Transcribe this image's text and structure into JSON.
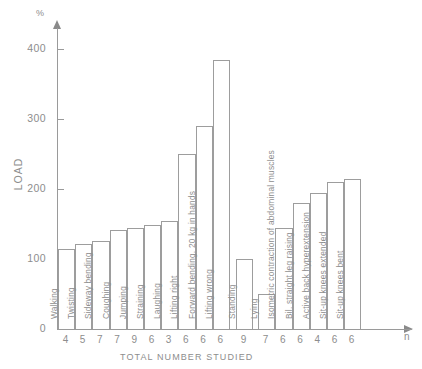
{
  "chart_data": {
    "type": "bar",
    "title": "",
    "xlabel": "TOTAL NUMBER STUDIED",
    "ylabel": "LOAD",
    "yunit": "%",
    "n_axis_label": "n",
    "ylim": [
      0,
      430
    ],
    "yticks": [
      0,
      100,
      200,
      300,
      400
    ],
    "ytick_labels": [
      "0",
      "100",
      "200",
      "300",
      "400"
    ],
    "grid": false,
    "legend": "none",
    "categories": [
      "Walking",
      "Twisting",
      "Sideway bending",
      "Coughing",
      "Jumping",
      "Straining",
      "Laughing",
      "Lifting right",
      "Forward bending. 20 kg in hands",
      "Lifting wrong",
      "Standing",
      "Lying",
      "Isometric contraction of abdominal muscles",
      "Bil. straight leg raising",
      "Active back hyperextension",
      "Sit-up knees extended",
      "Sit-up knees bent"
    ],
    "values": [
      115,
      121,
      126,
      141,
      144,
      149,
      155,
      250,
      290,
      385,
      100,
      50,
      145,
      180,
      195,
      210,
      215
    ],
    "n_values": [
      4,
      5,
      7,
      7,
      9,
      6,
      3,
      6,
      6,
      6,
      6,
      9,
      7,
      6,
      6,
      4,
      6,
      6
    ],
    "sample_sizes": [
      4,
      5,
      7,
      7,
      9,
      6,
      3,
      6,
      6,
      6,
      9,
      7,
      6,
      6,
      4,
      6,
      6
    ]
  },
  "colors": {
    "axis": "#9a9a9a",
    "bar_outline": "#9d9d9d",
    "bar_fill": "#ffffff",
    "text": "#8d8d8d",
    "background": "#ffffff"
  }
}
